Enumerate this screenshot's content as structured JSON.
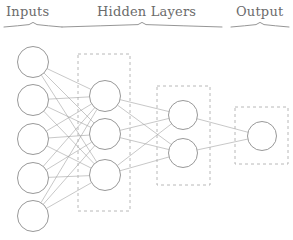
{
  "diagram": {
    "canvas": {
      "width": 293,
      "height": 240,
      "background": "#ffffff"
    },
    "style": {
      "node_stroke": "#8c8c8c",
      "node_fill": "#ffffff",
      "node_stroke_width": 0.9,
      "edge_color": "#9a9a9a",
      "edge_width": 0.55,
      "dashed_box_color": "#b0b0b0",
      "dashed_box_width": 0.9,
      "dashed_box_dash": "3,3",
      "brace_color": "#8a8a8a",
      "label_color": "#6b6b6b"
    },
    "labels": [
      {
        "name": "inputs-label",
        "text": "Inputs",
        "x": 6,
        "y": 4,
        "brace": {
          "x1": 4,
          "x2": 62,
          "y": 27,
          "tip_x": 33
        }
      },
      {
        "name": "hidden-layers-label",
        "text": "Hidden Layers",
        "x": 97,
        "y": 4,
        "brace": {
          "x1": 62,
          "x2": 222,
          "y": 27,
          "tip_x": 142
        }
      },
      {
        "name": "output-label",
        "text": "Output",
        "x": 236,
        "y": 4,
        "brace": {
          "x1": 231,
          "x2": 289,
          "y": 27,
          "tip_x": 260
        }
      }
    ],
    "layers": [
      {
        "name": "input-layer",
        "kind": "input",
        "node_count": 5,
        "radius": 15.5,
        "boxed": false,
        "nodes": [
          {
            "name": "input-node-1",
            "cx": 33,
            "cy": 62
          },
          {
            "name": "input-node-2",
            "cx": 33,
            "cy": 100
          },
          {
            "name": "input-node-3",
            "cx": 33,
            "cy": 139
          },
          {
            "name": "input-node-4",
            "cx": 33,
            "cy": 178
          },
          {
            "name": "input-node-5",
            "cx": 33,
            "cy": 216
          }
        ]
      },
      {
        "name": "hidden-layer-1",
        "kind": "hidden",
        "node_count": 3,
        "radius": 15.5,
        "boxed": true,
        "box": {
          "x": 78,
          "y": 54,
          "width": 52,
          "height": 157
        },
        "nodes": [
          {
            "name": "hidden1-node-1",
            "cx": 105,
            "cy": 96
          },
          {
            "name": "hidden1-node-2",
            "cx": 105,
            "cy": 134
          },
          {
            "name": "hidden1-node-3",
            "cx": 105,
            "cy": 175
          }
        ]
      },
      {
        "name": "hidden-layer-2",
        "kind": "hidden",
        "node_count": 2,
        "radius": 14.5,
        "boxed": true,
        "box": {
          "x": 157,
          "y": 86,
          "width": 53,
          "height": 99
        },
        "nodes": [
          {
            "name": "hidden2-node-1",
            "cx": 183,
            "cy": 115
          },
          {
            "name": "hidden2-node-2",
            "cx": 183,
            "cy": 153
          }
        ]
      },
      {
        "name": "output-layer",
        "kind": "output",
        "node_count": 1,
        "radius": 14.5,
        "boxed": true,
        "box": {
          "x": 235,
          "y": 107,
          "width": 53,
          "height": 57
        },
        "nodes": [
          {
            "name": "output-node-1",
            "cx": 262,
            "cy": 136
          }
        ]
      }
    ],
    "connections": [
      {
        "from": "input-layer",
        "to": "hidden-layer-1",
        "fully_connected": true,
        "count": 15
      },
      {
        "from": "hidden-layer-1",
        "to": "hidden-layer-2",
        "fully_connected": true,
        "count": 6
      },
      {
        "from": "hidden-layer-2",
        "to": "output-layer",
        "fully_connected": true,
        "count": 2
      }
    ]
  }
}
